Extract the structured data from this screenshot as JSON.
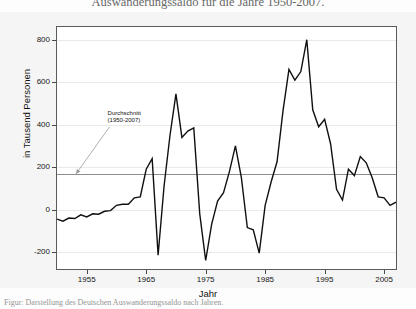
{
  "figure": {
    "title": "Auswanderungssaldo für die Jahre 1950-2007.",
    "caption": "Figur: Darstellung des Deutschen Auswanderungssaldo nach Jahren."
  },
  "chart_data": {
    "type": "line",
    "title": "Auswanderungssaldo für die Jahre 1950-2007.",
    "xlabel": "Jahr",
    "ylabel": "in Tausend Personen",
    "xlim": [
      1950,
      2007
    ],
    "ylim": [
      -280,
      860
    ],
    "yticks": [
      -200,
      0,
      200,
      400,
      600,
      800
    ],
    "ytick_labels": [
      "-200",
      "0",
      "200",
      "400",
      "600",
      "800"
    ],
    "xticks": [
      1955,
      1965,
      1975,
      1985,
      1995,
      2005
    ],
    "xtick_labels": [
      "1955",
      "1965",
      "1975",
      "1985",
      "1995",
      "2005"
    ],
    "grid": true,
    "legend": "none",
    "line_color": "#101010",
    "average_line": {
      "value": 168,
      "color": "#8d8d8d",
      "label": "Durchschnitt",
      "sublabel": "(1950-2007)"
    },
    "annotations": [
      {
        "text": "Durchschnitt",
        "text2": "(1950-2007)",
        "points_to_year": 1954,
        "points_to_value": 168
      }
    ],
    "x": [
      1950,
      1951,
      1952,
      1953,
      1954,
      1955,
      1956,
      1957,
      1958,
      1959,
      1960,
      1961,
      1962,
      1963,
      1964,
      1965,
      1966,
      1967,
      1968,
      1969,
      1970,
      1971,
      1972,
      1973,
      1974,
      1975,
      1976,
      1977,
      1978,
      1979,
      1980,
      1981,
      1982,
      1983,
      1984,
      1985,
      1986,
      1987,
      1988,
      1989,
      1990,
      1991,
      1992,
      1993,
      1994,
      1995,
      1996,
      1997,
      1998,
      1999,
      2000,
      2001,
      2002,
      2003,
      2004,
      2005,
      2006,
      2007
    ],
    "values": [
      -45,
      -55,
      -40,
      -42,
      -25,
      -35,
      -20,
      -22,
      -8,
      -5,
      20,
      25,
      25,
      55,
      60,
      190,
      240,
      -215,
      110,
      350,
      545,
      340,
      370,
      385,
      -20,
      -240,
      -70,
      40,
      80,
      180,
      300,
      150,
      -85,
      -95,
      -205,
      20,
      130,
      225,
      465,
      660,
      610,
      650,
      800,
      470,
      390,
      425,
      310,
      95,
      45,
      190,
      160,
      250,
      220,
      150,
      60,
      55,
      20,
      35
    ]
  }
}
